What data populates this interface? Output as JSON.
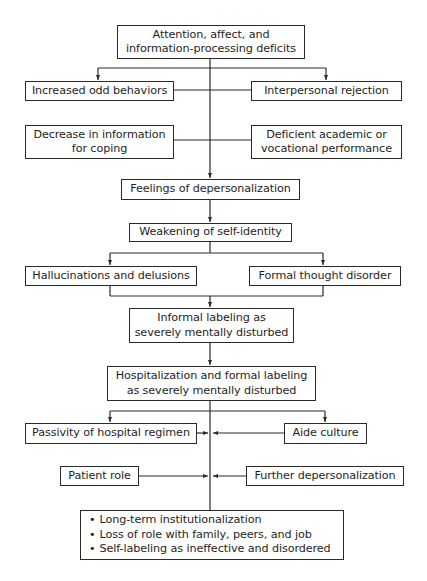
{
  "diagram": {
    "type": "flowchart",
    "nodes": {
      "n1": {
        "lines": [
          "Attention, affect, and",
          "information-processing deficits"
        ]
      },
      "n2": {
        "lines": [
          "Increased odd behaviors"
        ]
      },
      "n3": {
        "lines": [
          "Interpersonal rejection"
        ]
      },
      "n4": {
        "lines": [
          "Decrease in information",
          "for coping"
        ]
      },
      "n5": {
        "lines": [
          "Deficient academic or",
          "vocational performance"
        ]
      },
      "n6": {
        "lines": [
          "Feelings of depersonalization"
        ]
      },
      "n7": {
        "lines": [
          "Weakening of self-identity"
        ]
      },
      "n8": {
        "lines": [
          "Hallucinations and delusions"
        ]
      },
      "n9": {
        "lines": [
          "Formal thought disorder"
        ]
      },
      "n10": {
        "lines": [
          "Informal labeling as",
          "severely mentally disturbed"
        ]
      },
      "n11": {
        "lines": [
          "Hospitalization and formal labeling",
          "as severely mentally disturbed"
        ]
      },
      "n12": {
        "lines": [
          "Passivity of hospital regimen"
        ]
      },
      "n13": {
        "lines": [
          "Aide culture"
        ]
      },
      "n14": {
        "lines": [
          "Patient role"
        ]
      },
      "n15": {
        "lines": [
          "Further depersonalization"
        ]
      },
      "n16": {
        "lines": [
          "Long-term institutionalization",
          "Loss of role with family, peers, and job",
          "Self-labeling as ineffective and disordered"
        ]
      }
    },
    "edges": [
      {
        "from": "n1",
        "to": "n2"
      },
      {
        "from": "n1",
        "to": "n3"
      },
      {
        "from": "n2",
        "to": "main-line"
      },
      {
        "from": "n3",
        "to": "main-line"
      },
      {
        "from": "n4",
        "to": "main-line"
      },
      {
        "from": "n5",
        "to": "main-line"
      },
      {
        "from": "main-line",
        "to": "n6"
      },
      {
        "from": "n6",
        "to": "n7"
      },
      {
        "from": "n7",
        "to": "n8"
      },
      {
        "from": "n7",
        "to": "n9"
      },
      {
        "from": "n8",
        "to": "n10"
      },
      {
        "from": "n9",
        "to": "n10"
      },
      {
        "from": "n10",
        "to": "n11"
      },
      {
        "from": "n11",
        "to": "n12"
      },
      {
        "from": "n11",
        "to": "n13"
      },
      {
        "from": "n12",
        "to": "main-line"
      },
      {
        "from": "n13",
        "to": "main-line"
      },
      {
        "from": "n14",
        "to": "main-line"
      },
      {
        "from": "n15",
        "to": "main-line"
      },
      {
        "from": "main-line",
        "to": "n16"
      }
    ]
  }
}
